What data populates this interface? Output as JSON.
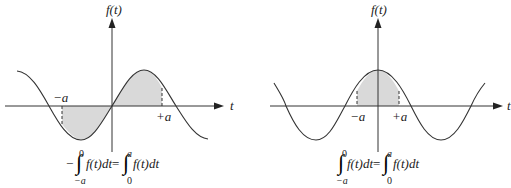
{
  "figures": [
    {
      "id": "odd-function",
      "y_axis_label": "f(t)",
      "x_axis_label": "t",
      "neg_limit_label": "−a",
      "pos_limit_label": "+a",
      "equation": {
        "prefix": "−",
        "left_integral": {
          "upper": "0",
          "lower": "−a",
          "integrand": "f(t)dt"
        },
        "equals": "=",
        "right_integral": {
          "upper": "a",
          "lower": "0",
          "integrand": "f(t)dt"
        }
      }
    },
    {
      "id": "even-function",
      "y_axis_label": "f(t)",
      "x_axis_label": "t",
      "neg_limit_label": "−a",
      "pos_limit_label": "+a",
      "equation": {
        "prefix": "",
        "left_integral": {
          "upper": "0",
          "lower": "−a",
          "integrand": "f(t)dt"
        },
        "equals": "=",
        "right_integral": {
          "upper": "a",
          "lower": "0",
          "integrand": "f(t)dt"
        }
      }
    }
  ],
  "colors": {
    "line": "#333333",
    "fill": "#d9d9d9"
  }
}
